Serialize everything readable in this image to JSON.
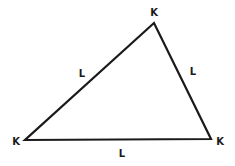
{
  "diagram": {
    "type": "triangle",
    "stroke_color": "#1a1a1a",
    "background": "#ffffff",
    "vertices": [
      {
        "id": "top",
        "x": 154,
        "y": 23,
        "label": "K",
        "label_x": 154,
        "label_y": 16
      },
      {
        "id": "bottom-left",
        "x": 25,
        "y": 140,
        "label": "K",
        "label_x": 16,
        "label_y": 145
      },
      {
        "id": "bottom-right",
        "x": 211,
        "y": 139,
        "label": "K",
        "label_x": 220,
        "label_y": 145
      }
    ],
    "edges": [
      {
        "id": "left-edge",
        "from": "bottom-left",
        "to": "top",
        "label": "L",
        "label_x": 82,
        "label_y": 77
      },
      {
        "id": "right-edge",
        "from": "top",
        "to": "bottom-right",
        "label": "L",
        "label_x": 193,
        "label_y": 75
      },
      {
        "id": "bottom-edge",
        "from": "bottom-left",
        "to": "bottom-right",
        "label": "L",
        "label_x": 122,
        "label_y": 157
      }
    ]
  }
}
